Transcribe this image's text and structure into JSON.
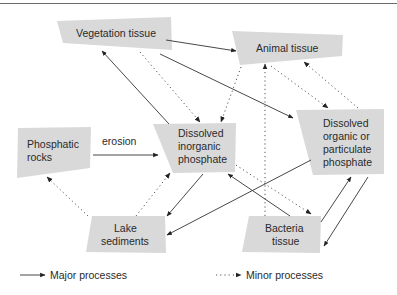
{
  "diagram": {
    "nodes": {
      "vegetation": {
        "lines": [
          "Vegetation tissue"
        ]
      },
      "animal": {
        "lines": [
          "Animal tissue"
        ]
      },
      "phosphatic_rocks": {
        "lines": [
          "Phosphatic",
          "rocks"
        ]
      },
      "dip": {
        "lines": [
          "Dissolved",
          "inorganic",
          "phosphate"
        ]
      },
      "dopp": {
        "lines": [
          "Dissolved",
          "organic or",
          "particulate",
          "phosphate"
        ]
      },
      "lake_sediments": {
        "lines": [
          "Lake",
          "sediments"
        ]
      },
      "bacteria": {
        "lines": [
          "Bacteria",
          "tissue"
        ]
      }
    },
    "edges": [
      {
        "from": "Phosphatic rocks",
        "to": "Dissolved inorganic phosphate",
        "type": "major",
        "label": "erosion"
      },
      {
        "from": "Dissolved inorganic phosphate",
        "to": "Vegetation tissue",
        "type": "major"
      },
      {
        "from": "Vegetation tissue",
        "to": "Dissolved inorganic phosphate",
        "type": "minor"
      },
      {
        "from": "Vegetation tissue",
        "to": "Animal tissue",
        "type": "major"
      },
      {
        "from": "Vegetation tissue",
        "to": "Dissolved organic or particulate phosphate",
        "type": "major"
      },
      {
        "from": "Animal tissue",
        "to": "Dissolved inorganic phosphate",
        "type": "minor"
      },
      {
        "from": "Animal tissue",
        "to": "Dissolved organic or particulate phosphate",
        "type": "minor"
      },
      {
        "from": "Dissolved organic or particulate phosphate",
        "to": "Animal tissue",
        "type": "minor"
      },
      {
        "from": "Bacteria tissue",
        "to": "Animal tissue",
        "type": "minor"
      },
      {
        "from": "Dissolved inorganic phosphate",
        "to": "Lake sediments",
        "type": "major"
      },
      {
        "from": "Lake sediments",
        "to": "Dissolved inorganic phosphate",
        "type": "minor"
      },
      {
        "from": "Lake sediments",
        "to": "Phosphatic rocks",
        "type": "minor"
      },
      {
        "from": "Dissolved organic or particulate phosphate",
        "to": "Lake sediments",
        "type": "major"
      },
      {
        "from": "Bacteria tissue",
        "to": "Dissolved inorganic phosphate",
        "type": "major"
      },
      {
        "from": "Dissolved inorganic phosphate",
        "to": "Bacteria tissue",
        "type": "minor"
      },
      {
        "from": "Bacteria tissue",
        "to": "Dissolved organic or particulate phosphate",
        "type": "major"
      },
      {
        "from": "Dissolved organic or particulate phosphate",
        "to": "Bacteria tissue",
        "type": "major"
      }
    ],
    "edge_label_erosion": "erosion"
  },
  "legend": {
    "major": "Major processes",
    "minor": "Minor processes"
  }
}
